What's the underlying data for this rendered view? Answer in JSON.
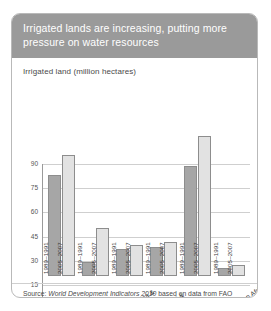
{
  "header": {
    "title": "Irrigated lands are increasing, putting more pressure on water resources"
  },
  "subtitle": "Irrigated land (million hectares)",
  "source": {
    "prefix": "Source: ",
    "publication": "World Development Indicators 2010",
    "suffix": " based on data from FAO"
  },
  "colors": {
    "header_bg": "#9a9a9a",
    "series1": "#a6a6a6",
    "series2": "#e2e2e2",
    "grid": "#cfcfcf",
    "axis": "#9a9a9a"
  },
  "chart_data": {
    "type": "bar",
    "title": "Irrigated land (million hectares)",
    "xlabel": "",
    "ylabel": "",
    "ylim": [
      0,
      90
    ],
    "yticks": [
      0,
      15,
      30,
      45,
      60,
      75,
      90
    ],
    "grid": true,
    "legend": "in-bar labels",
    "categories": [
      "East Asia & Pacific",
      "Europe & Central Asia",
      "Latin America & Caribbean",
      "Middle East & North Africa",
      "South Asia",
      "Sub-Saharan Africa"
    ],
    "series": [
      {
        "name": "1989–1991",
        "values": [
          63,
          9,
          17,
          18,
          68,
          5
        ]
      },
      {
        "name": "2005–2007",
        "values": [
          75,
          30,
          19,
          21,
          87,
          7
        ]
      }
    ]
  }
}
